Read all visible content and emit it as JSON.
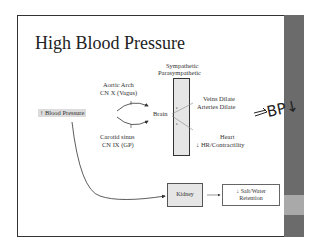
{
  "slide": {
    "title": "High Blood Pressure",
    "header_top": "Sympathetic",
    "header_bottom": "Parasympathetic",
    "trigger": "↑ Blood Pressure",
    "aortic_line1": "Aortic Arch",
    "aortic_line2": "CN X (Vagus)",
    "carotid_line1": "Carotid sinus",
    "carotid_line2": "CN IX (GP)",
    "brain": "Brain",
    "veins": "Veins Dilate",
    "arteries": "Arteries Dilate",
    "heart": "Heart",
    "heart_effect": "↓ HR/Contractility",
    "kidney": "Kidney",
    "salt_line1": "↓ Salt/Water",
    "salt_line2": "Retention",
    "annotation": "BP↓",
    "colors": {
      "sidebar": "#6b6b6b",
      "sidebar_band": "#a9a9a9",
      "box_fill": "#e6e6e6"
    }
  }
}
